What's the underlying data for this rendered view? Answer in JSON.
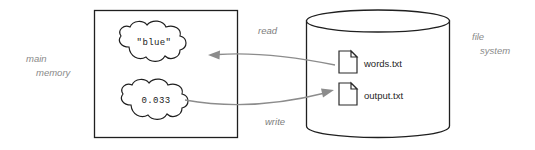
{
  "diagram": {
    "background_color": "#ffffff",
    "labels": {
      "main_memory_line1": "main",
      "main_memory_line2": "memory",
      "file_system_line1": "file",
      "file_system_line2": "system"
    },
    "memory_box": {
      "name": "main memory",
      "values": [
        {
          "text": "\"blue\"",
          "kind": "string"
        },
        {
          "text": "0.033",
          "kind": "float"
        }
      ]
    },
    "file_system": {
      "name": "file system",
      "files": [
        {
          "label": "words.txt",
          "icon": "file-icon"
        },
        {
          "label": "output.txt",
          "icon": "file-icon"
        }
      ]
    },
    "arrows": [
      {
        "label": "read",
        "direction": "file-to-memory"
      },
      {
        "label": "write",
        "direction": "memory-to-file"
      }
    ],
    "colors": {
      "outline": "#1f1f1f",
      "arrow": "#8c8c8c",
      "side_label": "#8a8a8a",
      "edge_label": "#7d7d7d",
      "value_text": "#1a1a1a",
      "file_text": "#262626"
    }
  }
}
